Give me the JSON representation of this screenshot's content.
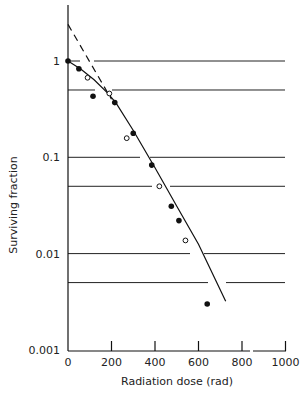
{
  "chart_data": {
    "type": "scatter",
    "title": "",
    "xlabel": "Radiation dose (rad)",
    "ylabel": "Surviving fraction",
    "xlim": [
      0,
      1000
    ],
    "ylim": [
      0.001,
      3
    ],
    "yscale": "log",
    "x_ticks": [
      0,
      200,
      400,
      600,
      800,
      1000
    ],
    "x_tick_labels": [
      "0",
      "200",
      "400",
      "600",
      "800",
      "1000"
    ],
    "y_ticks": [
      1,
      0.1,
      0.01,
      0.001
    ],
    "y_tick_labels": [
      "1",
      "0.1",
      "0.01",
      "0.001"
    ],
    "grid": true,
    "gridlines_y": [
      1,
      0.5,
      0.1,
      0.05,
      0.01,
      0.005
    ],
    "legend": null,
    "series": [
      {
        "name": "filled circles",
        "marker": "filled-circle",
        "x": [
          0,
          50,
          115,
          215,
          300,
          385,
          475,
          510,
          640
        ],
        "y": [
          1.0,
          0.83,
          0.43,
          0.37,
          0.178,
          0.083,
          0.031,
          0.022,
          0.003
        ]
      },
      {
        "name": "open circles",
        "marker": "open-circle",
        "x": [
          90,
          190,
          270,
          420,
          540
        ],
        "y": [
          0.67,
          0.46,
          0.158,
          0.05,
          0.0137
        ]
      }
    ],
    "fit_curve": {
      "name": "survival curve (solid)",
      "style": "solid",
      "x": [
        0,
        60,
        120,
        180,
        220,
        300,
        400,
        500,
        600,
        725
      ],
      "y": [
        1.0,
        0.82,
        0.64,
        0.47,
        0.37,
        0.19,
        0.078,
        0.031,
        0.0125,
        0.0032
      ]
    },
    "extrapolation": {
      "name": "extrapolation of linear portion (dashed)",
      "style": "dashed",
      "x": [
        0,
        200
      ],
      "y": [
        2.4,
        0.4
      ]
    }
  }
}
